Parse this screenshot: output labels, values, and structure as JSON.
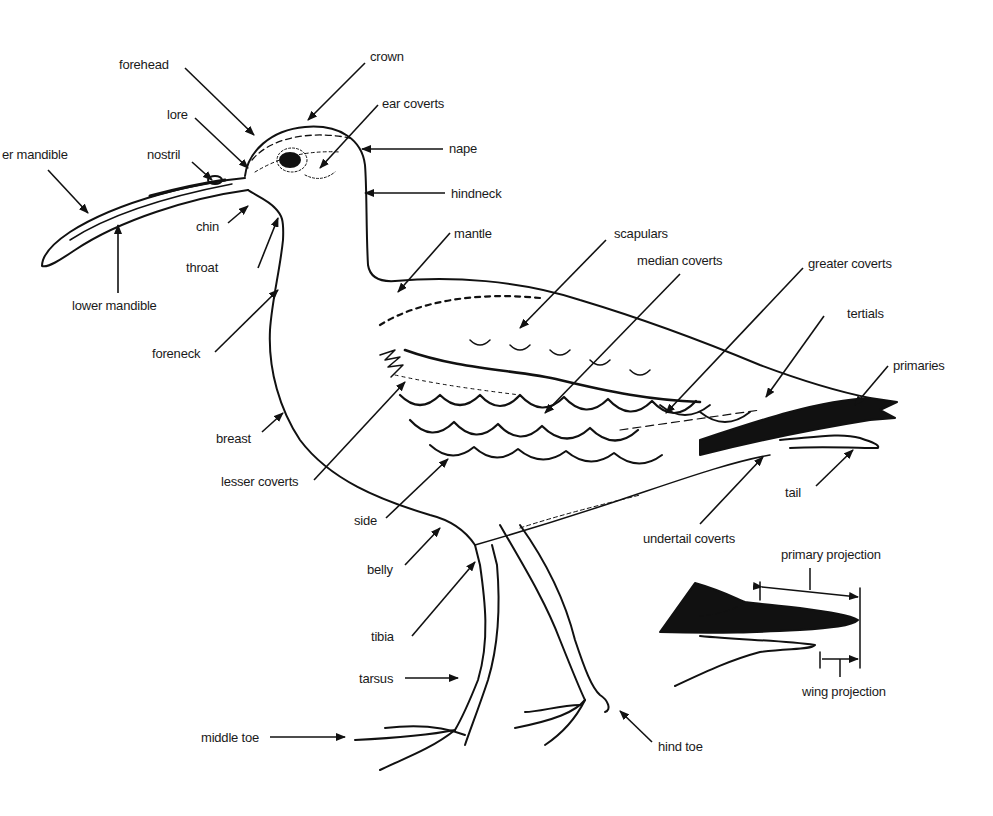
{
  "diagram": {
    "ink_color": "#111111",
    "background": "#ffffff",
    "labels": {
      "upper_mandible": "er mandible",
      "forehead": "forehead",
      "crown": "crown",
      "lore": "lore",
      "ear_coverts": "ear coverts",
      "nostril": "nostril",
      "nape": "nape",
      "hindneck": "hindneck",
      "chin": "chin",
      "throat": "throat",
      "lower_mandible": "lower mandible",
      "mantle": "mantle",
      "scapulars": "scapulars",
      "median_coverts": "median coverts",
      "greater_coverts": "greater coverts",
      "tertials": "tertials",
      "primaries": "primaries",
      "foreneck": "foreneck",
      "breast": "breast",
      "lesser_coverts": "lesser coverts",
      "side": "side",
      "tail": "tail",
      "undertail_coverts": "undertail coverts",
      "belly": "belly",
      "primary_projection": "primary projection",
      "tibia": "tibia",
      "tarsus": "tarsus",
      "wing_projection": "wing projection",
      "middle_toe": "middle toe",
      "hind_toe": "hind toe"
    }
  }
}
